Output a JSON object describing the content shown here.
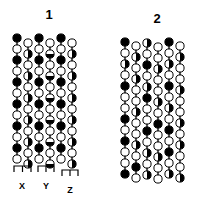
{
  "figure": {
    "background_color": "#ffffff",
    "ink_color": "#000000",
    "width": 207,
    "height": 201
  },
  "style": {
    "circle_radius": 4.1,
    "stroke_width": 1.0,
    "row_pitch": 11.0,
    "column_pitch": 11.0
  },
  "panels": [
    {
      "id": "panel-1",
      "label": "1",
      "label_x": 39,
      "label_y": 8,
      "origin_x": 17,
      "origin_y": 38,
      "columns": [
        {
          "name": "column-1",
          "x_offset": 0,
          "y_offset": 0,
          "beads": [
            "filled",
            "open",
            "filled",
            "open",
            "filled",
            "open",
            "filled",
            "open",
            "filled",
            "open",
            "filled",
            "open"
          ]
        },
        {
          "name": "column-2",
          "x_offset": 11,
          "y_offset": 5,
          "beads": [
            "open",
            "half-right",
            "open",
            "half-right",
            "open",
            "half-right",
            "open",
            "half-right",
            "open",
            "half-right",
            "open",
            "half-right"
          ]
        },
        {
          "name": "column-3",
          "x_offset": 22,
          "y_offset": 0,
          "beads": [
            "filled",
            "open",
            "filled",
            "open",
            "filled",
            "open",
            "filled",
            "open",
            "filled",
            "open",
            "filled",
            "open"
          ]
        },
        {
          "name": "column-4",
          "x_offset": 33,
          "y_offset": 5,
          "beads": [
            "open",
            "half-bottom",
            "open",
            "half-bottom",
            "open",
            "half-bottom",
            "open",
            "half-bottom",
            "open",
            "half-bottom",
            "open",
            "half-bottom"
          ]
        },
        {
          "name": "column-5",
          "x_offset": 44,
          "y_offset": 0,
          "beads": [
            "filled",
            "open",
            "filled",
            "open",
            "filled",
            "open",
            "filled",
            "open",
            "filled",
            "open",
            "filled",
            "open"
          ]
        },
        {
          "name": "column-6",
          "x_offset": 55,
          "y_offset": 5,
          "beads": [
            "open",
            "half-right",
            "open",
            "half-right",
            "open",
            "half-right",
            "open",
            "half-right",
            "open",
            "half-right",
            "open",
            "half-right"
          ]
        }
      ],
      "brackets": [
        {
          "name": "bracket-x",
          "label": "X",
          "left": 14,
          "right": 31,
          "top": 166,
          "tick": 6,
          "label_x": 14,
          "label_y": 182
        },
        {
          "name": "bracket-y",
          "label": "Y",
          "left": 38,
          "right": 54,
          "top": 166,
          "tick": 6,
          "label_x": 38,
          "label_y": 182
        },
        {
          "name": "bracket-z",
          "label": "Z",
          "left": 62,
          "right": 78,
          "top": 170,
          "tick": 6,
          "label_x": 62,
          "label_y": 186
        }
      ]
    },
    {
      "id": "panel-2",
      "label": "2",
      "label_x": 147,
      "label_y": 12,
      "origin_x": 125,
      "origin_y": 42,
      "columns": [
        {
          "name": "column-1",
          "x_offset": 0,
          "y_offset": 0,
          "beads": [
            "filled",
            "open",
            "half-right",
            "open",
            "filled",
            "open",
            "open",
            "filled",
            "open",
            "filled",
            "open",
            "open",
            "filled"
          ]
        },
        {
          "name": "column-2",
          "x_offset": 11,
          "y_offset": 4,
          "beads": [
            "open",
            "half-right",
            "open",
            "half-right",
            "open",
            "open",
            "half-right",
            "open",
            "open",
            "half-right",
            "open",
            "filled",
            "open"
          ]
        },
        {
          "name": "column-3",
          "x_offset": 22,
          "y_offset": 1,
          "beads": [
            "half-right",
            "open",
            "filled",
            "open",
            "half-right",
            "filled",
            "open",
            "open",
            "filled",
            "open",
            "half-right",
            "open",
            "half-right"
          ]
        },
        {
          "name": "column-4",
          "x_offset": 33,
          "y_offset": 5,
          "beads": [
            "open",
            "open",
            "half-right",
            "open",
            "open",
            "half-right",
            "open",
            "filled",
            "open",
            "open",
            "half-right",
            "open",
            "open"
          ]
        },
        {
          "name": "column-5",
          "x_offset": 44,
          "y_offset": 0,
          "beads": [
            "filled",
            "open",
            "half-right",
            "open",
            "filled",
            "open",
            "half-right",
            "open",
            "filled",
            "open",
            "filled",
            "open",
            "half-right"
          ]
        },
        {
          "name": "column-6",
          "x_offset": 55,
          "y_offset": 4,
          "beads": [
            "open",
            "half-right",
            "open",
            "open",
            "half-right",
            "open",
            "open",
            "half-right",
            "open",
            "half-right",
            "open",
            "open",
            "half-right"
          ]
        }
      ],
      "brackets": []
    }
  ]
}
